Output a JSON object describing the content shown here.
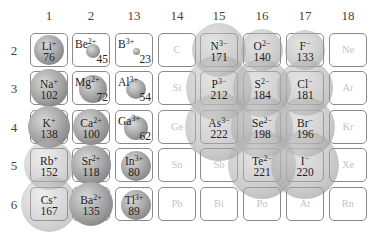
{
  "colors": {
    "cell_border": "#8a8a8a",
    "sphere": "#9a9a9a",
    "noble_text": "#c4c4c4"
  },
  "columns": [
    {
      "label": "1",
      "x": 30
    },
    {
      "label": "2",
      "x": 72
    },
    {
      "label": "13",
      "x": 115
    },
    {
      "label": "14",
      "x": 158
    },
    {
      "label": "15",
      "x": 200
    },
    {
      "label": "16",
      "x": 243
    },
    {
      "label": "17",
      "x": 286
    },
    {
      "label": "18",
      "x": 329
    }
  ],
  "rows": [
    {
      "label": "2",
      "y": 33
    },
    {
      "label": "3",
      "y": 71
    },
    {
      "label": "4",
      "y": 110
    },
    {
      "label": "5",
      "y": 148
    },
    {
      "label": "6",
      "y": 187
    }
  ],
  "ions": [
    {
      "symbol": "Li",
      "charge": "+",
      "radius": "76",
      "col": 0,
      "row": 0,
      "type": "cation",
      "d": 30
    },
    {
      "symbol": "Be",
      "charge": "2+",
      "radius": "45",
      "col": 1,
      "row": 0,
      "type": "cation",
      "d": 14
    },
    {
      "symbol": "B",
      "charge": "3+",
      "radius": "23",
      "col": 2,
      "row": 0,
      "type": "cation",
      "d": 7
    },
    {
      "symbol": "Na",
      "charge": "+",
      "radius": "102",
      "col": 0,
      "row": 1,
      "type": "cation",
      "d": 38
    },
    {
      "symbol": "Mg",
      "charge": "2+",
      "radius": "72",
      "col": 1,
      "row": 1,
      "type": "cation",
      "d": 28
    },
    {
      "symbol": "Al",
      "charge": "3+",
      "radius": "54",
      "col": 2,
      "row": 1,
      "type": "cation",
      "d": 20
    },
    {
      "symbol": "K",
      "charge": "+",
      "radius": "138",
      "col": 0,
      "row": 2,
      "type": "cation",
      "d": 42
    },
    {
      "symbol": "Ca",
      "charge": "2+",
      "radius": "100",
      "col": 1,
      "row": 2,
      "type": "cation",
      "d": 36
    },
    {
      "symbol": "Ga",
      "charge": "3+",
      "radius": "62",
      "col": 2,
      "row": 2,
      "type": "cation",
      "d": 24
    },
    {
      "symbol": "Rb",
      "charge": "+",
      "radius": "152",
      "col": 0,
      "row": 3,
      "type": "cation-light",
      "d": 50
    },
    {
      "symbol": "Sr",
      "charge": "2+",
      "radius": "118",
      "col": 1,
      "row": 3,
      "type": "cation",
      "d": 40
    },
    {
      "symbol": "In",
      "charge": "3+",
      "radius": "80",
      "col": 2,
      "row": 3,
      "type": "cation",
      "d": 30
    },
    {
      "symbol": "Cs",
      "charge": "+",
      "radius": "167",
      "col": 0,
      "row": 4,
      "type": "cation-light",
      "d": 56
    },
    {
      "symbol": "Ba",
      "charge": "2+",
      "radius": "135",
      "col": 1,
      "row": 4,
      "type": "cation",
      "d": 44
    },
    {
      "symbol": "Tl",
      "charge": "3+",
      "radius": "89",
      "col": 2,
      "row": 4,
      "type": "cation",
      "d": 30
    },
    {
      "symbol": "N",
      "charge": "3−",
      "radius": "171",
      "col": 4,
      "row": 0,
      "type": "anion",
      "d": 54
    },
    {
      "symbol": "O",
      "charge": "2−",
      "radius": "140",
      "col": 5,
      "row": 0,
      "type": "anion",
      "d": 42
    },
    {
      "symbol": "F",
      "charge": "−",
      "radius": "133",
      "col": 6,
      "row": 0,
      "type": "anion",
      "d": 40
    },
    {
      "symbol": "P",
      "charge": "3−",
      "radius": "212",
      "col": 4,
      "row": 1,
      "type": "anion",
      "d": 66
    },
    {
      "symbol": "S",
      "charge": "2−",
      "radius": "184",
      "col": 5,
      "row": 1,
      "type": "anion",
      "d": 58
    },
    {
      "symbol": "Cl",
      "charge": "−",
      "radius": "181",
      "col": 6,
      "row": 1,
      "type": "anion",
      "d": 56
    },
    {
      "symbol": "As",
      "charge": "3−",
      "radius": "222",
      "col": 4,
      "row": 2,
      "type": "anion",
      "d": 68
    },
    {
      "symbol": "Se",
      "charge": "2−",
      "radius": "198",
      "col": 5,
      "row": 2,
      "type": "anion",
      "d": 62
    },
    {
      "symbol": "Br",
      "charge": "−",
      "radius": "196",
      "col": 6,
      "row": 2,
      "type": "anion",
      "d": 60
    },
    {
      "symbol": "Te",
      "charge": "2−",
      "radius": "221",
      "col": 5,
      "row": 3,
      "type": "anion",
      "d": 68
    },
    {
      "symbol": "I",
      "charge": "−",
      "radius": "220",
      "col": 6,
      "row": 3,
      "type": "anion",
      "d": 68
    }
  ],
  "neutral": [
    {
      "symbol": "C",
      "col": 3,
      "row": 0
    },
    {
      "symbol": "Ne",
      "col": 7,
      "row": 0
    },
    {
      "symbol": "Si",
      "col": 3,
      "row": 1
    },
    {
      "symbol": "Ar",
      "col": 7,
      "row": 1
    },
    {
      "symbol": "Ge",
      "col": 3,
      "row": 2
    },
    {
      "symbol": "Kr",
      "col": 7,
      "row": 2
    },
    {
      "symbol": "Sn",
      "col": 3,
      "row": 3
    },
    {
      "symbol": "Sb",
      "col": 4,
      "row": 3
    },
    {
      "symbol": "Xe",
      "col": 7,
      "row": 3
    },
    {
      "symbol": "Pb",
      "col": 3,
      "row": 4
    },
    {
      "symbol": "Bi",
      "col": 4,
      "row": 4
    },
    {
      "symbol": "Po",
      "col": 5,
      "row": 4
    },
    {
      "symbol": "At",
      "col": 6,
      "row": 4
    },
    {
      "symbol": "Rn",
      "col": 7,
      "row": 4
    }
  ]
}
